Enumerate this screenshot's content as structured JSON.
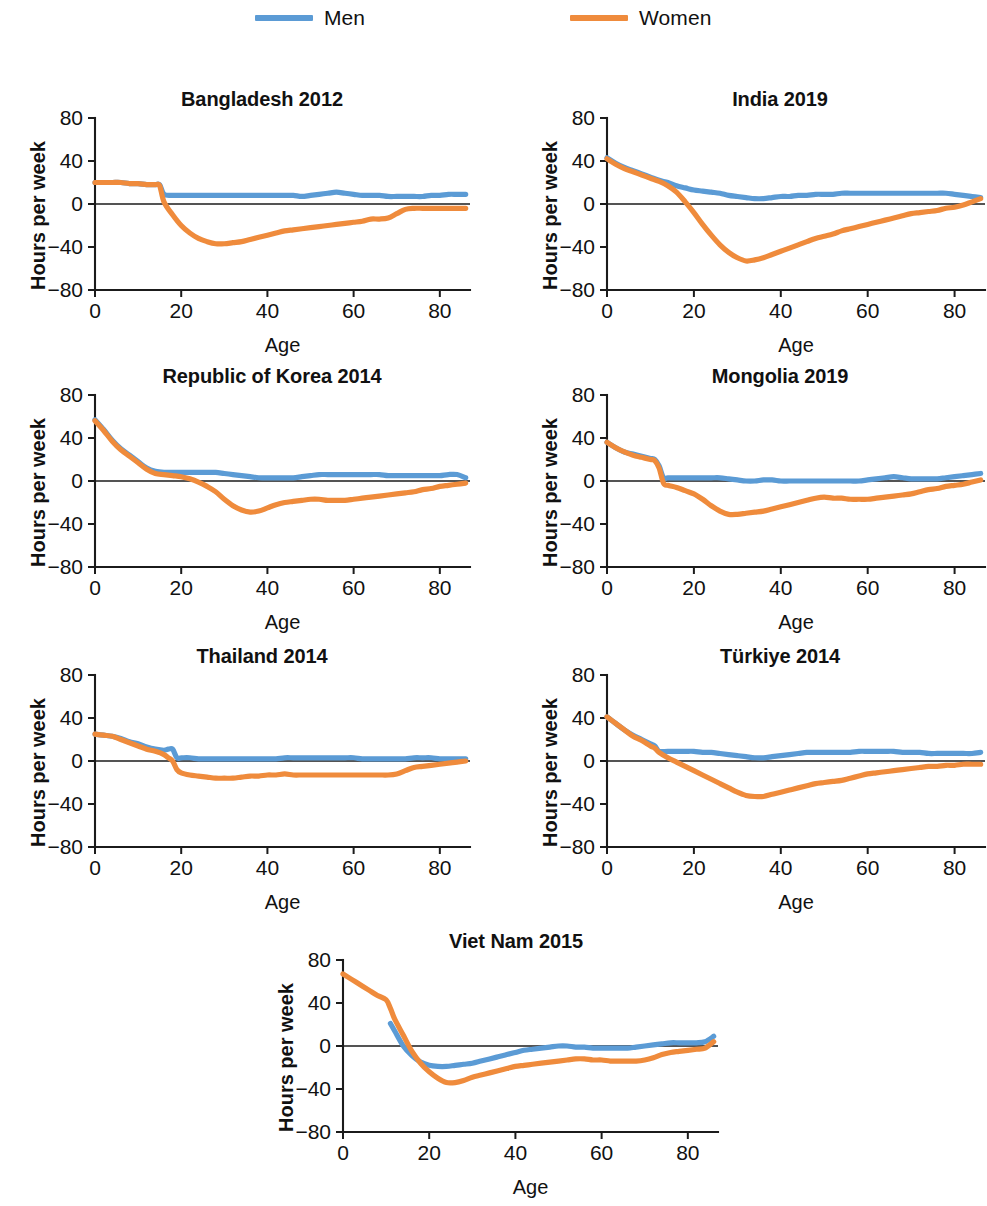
{
  "legend": {
    "entries": [
      {
        "label": "Men",
        "color": "#5b9bd5",
        "key": "men"
      },
      {
        "label": "Women",
        "color": "#ef8b3c",
        "key": "women"
      }
    ]
  },
  "axes": {
    "ylabel": "Hours per week",
    "xlabel": "Age",
    "yticks": [
      "80",
      "40",
      "0",
      "−40",
      "−80"
    ],
    "xticks": [
      "0",
      "20",
      "40",
      "60",
      "80"
    ],
    "ylim": [
      -80,
      80
    ],
    "xlim": [
      0,
      87
    ]
  },
  "chart_data": {
    "type": "line",
    "xlabel": "Age",
    "ylabel": "Hours per week",
    "xlim": [
      0,
      87
    ],
    "ylim": [
      -80,
      80
    ],
    "xticks": [
      0,
      20,
      40,
      60,
      80
    ],
    "yticks": [
      80,
      40,
      0,
      -40,
      -80
    ],
    "grid": false,
    "legend_position": "top",
    "legend": [
      "Men",
      "Women"
    ],
    "colors": {
      "Men": "#5b9bd5",
      "Women": "#ef8b3c"
    },
    "panels": [
      {
        "title": "Bangladesh 2012",
        "x": [
          0,
          2,
          4,
          6,
          8,
          10,
          12,
          14,
          15,
          16,
          18,
          20,
          22,
          24,
          26,
          28,
          30,
          32,
          34,
          36,
          38,
          40,
          42,
          44,
          46,
          48,
          50,
          52,
          54,
          56,
          58,
          60,
          62,
          64,
          66,
          68,
          70,
          72,
          74,
          76,
          78,
          80,
          82,
          84,
          86
        ],
        "series": [
          {
            "name": "Men",
            "values": [
              20,
              20,
              20,
              20,
              19,
              19,
              18,
              18,
              18,
              9,
              8,
              8,
              8,
              8,
              8,
              8,
              8,
              8,
              8,
              8,
              8,
              8,
              8,
              8,
              8,
              7,
              8,
              9,
              10,
              11,
              10,
              9,
              8,
              8,
              8,
              7,
              7,
              7,
              7,
              7,
              8,
              8,
              9,
              9,
              9
            ]
          },
          {
            "name": "Women",
            "values": [
              20,
              20,
              20,
              20,
              19,
              19,
              18,
              18,
              17,
              2,
              -10,
              -20,
              -27,
              -32,
              -35,
              -37,
              -37,
              -36,
              -35,
              -33,
              -31,
              -29,
              -27,
              -25,
              -24,
              -23,
              -22,
              -21,
              -20,
              -19,
              -18,
              -17,
              -16,
              -14,
              -14,
              -13,
              -9,
              -5,
              -4,
              -4,
              -4,
              -4,
              -4,
              -4,
              -4
            ]
          }
        ]
      },
      {
        "title": "India 2019",
        "x": [
          0,
          2,
          4,
          6,
          8,
          10,
          12,
          14,
          16,
          18,
          20,
          22,
          24,
          26,
          28,
          30,
          32,
          34,
          36,
          38,
          40,
          42,
          44,
          46,
          48,
          50,
          52,
          54,
          56,
          58,
          60,
          62,
          64,
          66,
          68,
          70,
          72,
          74,
          76,
          78,
          80,
          82,
          84,
          86
        ],
        "series": [
          {
            "name": "Men",
            "values": [
              43,
              38,
              34,
              31,
              28,
              25,
              22,
              20,
              17,
              15,
              13,
              12,
              11,
              10,
              8,
              7,
              6,
              5,
              5,
              6,
              7,
              7,
              8,
              8,
              9,
              9,
              9,
              10,
              10,
              10,
              10,
              10,
              10,
              10,
              10,
              10,
              10,
              10,
              10,
              10,
              9,
              8,
              7,
              6
            ]
          },
          {
            "name": "Women",
            "values": [
              42,
              37,
              33,
              30,
              27,
              24,
              21,
              17,
              11,
              2,
              -8,
              -19,
              -29,
              -38,
              -45,
              -50,
              -53,
              -52,
              -50,
              -47,
              -44,
              -41,
              -38,
              -35,
              -32,
              -30,
              -28,
              -25,
              -23,
              -21,
              -19,
              -17,
              -15,
              -13,
              -11,
              -9,
              -8,
              -7,
              -6,
              -4,
              -3,
              -1,
              2,
              5
            ]
          }
        ]
      },
      {
        "title": "Republic of Korea 2014",
        "x": [
          0,
          2,
          4,
          6,
          8,
          10,
          12,
          14,
          16,
          18,
          20,
          22,
          24,
          26,
          28,
          30,
          32,
          34,
          36,
          38,
          40,
          42,
          44,
          46,
          48,
          50,
          52,
          54,
          56,
          58,
          60,
          62,
          64,
          66,
          68,
          70,
          72,
          74,
          76,
          78,
          80,
          82,
          84,
          86
        ],
        "series": [
          {
            "name": "Men",
            "values": [
              57,
              48,
              38,
              30,
              24,
              18,
              12,
              9,
              8,
              8,
              8,
              8,
              8,
              8,
              8,
              7,
              6,
              5,
              4,
              3,
              3,
              3,
              3,
              3,
              4,
              5,
              6,
              6,
              6,
              6,
              6,
              6,
              6,
              6,
              5,
              5,
              5,
              5,
              5,
              5,
              5,
              6,
              6,
              3
            ]
          },
          {
            "name": "Women",
            "values": [
              56,
              47,
              37,
              29,
              23,
              17,
              11,
              7,
              6,
              5,
              4,
              2,
              -1,
              -5,
              -10,
              -17,
              -23,
              -27,
              -29,
              -28,
              -25,
              -22,
              -20,
              -19,
              -18,
              -17,
              -17,
              -18,
              -18,
              -18,
              -17,
              -16,
              -15,
              -14,
              -13,
              -12,
              -11,
              -10,
              -8,
              -7,
              -5,
              -4,
              -3,
              -2
            ]
          }
        ]
      },
      {
        "title": "Mongolia 2019",
        "x": [
          0,
          2,
          4,
          6,
          8,
          10,
          11,
          12,
          13,
          14,
          16,
          18,
          20,
          22,
          24,
          26,
          28,
          30,
          32,
          34,
          36,
          38,
          40,
          42,
          44,
          46,
          48,
          50,
          52,
          54,
          56,
          58,
          60,
          62,
          64,
          66,
          68,
          70,
          72,
          74,
          76,
          78,
          80,
          82,
          84,
          86
        ],
        "series": [
          {
            "name": "Men",
            "values": [
              36,
              31,
              27,
              25,
              23,
              21,
              20,
              14,
              3,
              3,
              3,
              3,
              3,
              3,
              3,
              3,
              2,
              1,
              0,
              0,
              1,
              1,
              0,
              0,
              0,
              0,
              0,
              0,
              0,
              0,
              0,
              0,
              1,
              2,
              3,
              4,
              3,
              2,
              2,
              2,
              2,
              3,
              4,
              5,
              6,
              7
            ]
          },
          {
            "name": "Women",
            "values": [
              36,
              31,
              27,
              24,
              22,
              20,
              19,
              12,
              -2,
              -4,
              -6,
              -9,
              -12,
              -17,
              -23,
              -28,
              -31,
              -31,
              -30,
              -29,
              -28,
              -26,
              -24,
              -22,
              -20,
              -18,
              -16,
              -15,
              -16,
              -16,
              -17,
              -17,
              -17,
              -16,
              -15,
              -14,
              -13,
              -12,
              -10,
              -8,
              -7,
              -5,
              -4,
              -3,
              -1,
              1
            ]
          }
        ]
      },
      {
        "title": "Thailand 2014",
        "x": [
          0,
          2,
          4,
          6,
          8,
          10,
          12,
          14,
          16,
          17,
          18,
          19,
          20,
          22,
          24,
          26,
          28,
          30,
          32,
          34,
          36,
          38,
          40,
          42,
          44,
          46,
          48,
          50,
          52,
          54,
          56,
          58,
          60,
          62,
          64,
          66,
          68,
          70,
          72,
          74,
          76,
          78,
          80,
          82,
          84,
          86
        ],
        "series": [
          {
            "name": "Men",
            "values": [
              25,
              24,
              23,
              21,
              18,
              16,
              13,
              11,
              10,
              11,
              11,
              3,
              3,
              3,
              2,
              2,
              2,
              2,
              2,
              2,
              2,
              2,
              2,
              2,
              3,
              3,
              3,
              3,
              3,
              3,
              3,
              3,
              3,
              2,
              2,
              2,
              2,
              2,
              2,
              3,
              3,
              3,
              2,
              2,
              2,
              2
            ]
          },
          {
            "name": "Women",
            "values": [
              25,
              24,
              23,
              20,
              17,
              14,
              11,
              9,
              6,
              3,
              0,
              -8,
              -11,
              -13,
              -14,
              -15,
              -16,
              -16,
              -16,
              -15,
              -14,
              -14,
              -13,
              -13,
              -12,
              -13,
              -13,
              -13,
              -13,
              -13,
              -13,
              -13,
              -13,
              -13,
              -13,
              -13,
              -13,
              -12,
              -9,
              -6,
              -5,
              -4,
              -3,
              -2,
              -1,
              0
            ]
          }
        ]
      },
      {
        "title": "Türkiye 2014",
        "x": [
          0,
          2,
          4,
          6,
          8,
          10,
          11,
          12,
          14,
          16,
          18,
          20,
          22,
          24,
          26,
          28,
          30,
          32,
          34,
          36,
          38,
          40,
          42,
          44,
          46,
          48,
          50,
          52,
          54,
          56,
          58,
          60,
          62,
          64,
          66,
          68,
          70,
          72,
          74,
          76,
          78,
          80,
          82,
          84,
          86
        ],
        "series": [
          {
            "name": "Men",
            "values": [
              41,
              35,
              29,
              24,
              20,
              16,
              14,
              9,
              9,
              9,
              9,
              9,
              8,
              8,
              7,
              6,
              5,
              4,
              3,
              3,
              4,
              5,
              6,
              7,
              8,
              8,
              8,
              8,
              8,
              8,
              9,
              9,
              9,
              9,
              9,
              8,
              8,
              8,
              7,
              7,
              7,
              7,
              7,
              7,
              8
            ]
          },
          {
            "name": "Women",
            "values": [
              41,
              35,
              29,
              23,
              19,
              14,
              12,
              8,
              3,
              -1,
              -5,
              -9,
              -13,
              -17,
              -21,
              -25,
              -29,
              -32,
              -33,
              -33,
              -31,
              -29,
              -27,
              -25,
              -23,
              -21,
              -20,
              -19,
              -18,
              -16,
              -14,
              -12,
              -11,
              -10,
              -9,
              -8,
              -7,
              -6,
              -5,
              -5,
              -4,
              -4,
              -3,
              -3,
              -3
            ]
          }
        ]
      },
      {
        "title": "Viet Nam 2015",
        "x": [
          0,
          2,
          4,
          6,
          8,
          10,
          11,
          12,
          14,
          16,
          18,
          20,
          22,
          24,
          26,
          28,
          30,
          32,
          34,
          36,
          38,
          40,
          42,
          44,
          46,
          48,
          50,
          52,
          54,
          56,
          58,
          60,
          62,
          64,
          66,
          68,
          70,
          72,
          74,
          76,
          78,
          80,
          82,
          84,
          86
        ],
        "series": [
          {
            "name": "Men",
            "values": [
              null,
              null,
              null,
              null,
              null,
              null,
              21,
              14,
              0,
              -9,
              -15,
              -18,
              -19,
              -19,
              -18,
              -17,
              -16,
              -14,
              -12,
              -10,
              -8,
              -6,
              -4,
              -3,
              -2,
              -1,
              0,
              0,
              -1,
              -1,
              -2,
              -2,
              -2,
              -2,
              -2,
              -1,
              0,
              1,
              2,
              3,
              3,
              3,
              3,
              4,
              9
            ]
          },
          {
            "name": "Women",
            "values": [
              67,
              62,
              57,
              52,
              47,
              43,
              35,
              25,
              10,
              -5,
              -16,
              -24,
              -30,
              -34,
              -34,
              -32,
              -29,
              -27,
              -25,
              -23,
              -21,
              -19,
              -18,
              -17,
              -16,
              -15,
              -14,
              -13,
              -12,
              -12,
              -13,
              -13,
              -14,
              -14,
              -14,
              -14,
              -13,
              -11,
              -8,
              -6,
              -5,
              -4,
              -3,
              -2,
              4
            ]
          }
        ]
      }
    ]
  }
}
